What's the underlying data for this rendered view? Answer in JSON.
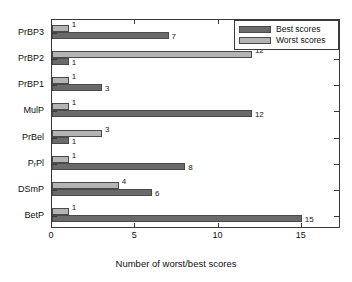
{
  "chart_data": {
    "type": "bar",
    "orientation": "horizontal",
    "title": "",
    "xlabel": "Number of worst/best scores",
    "ylabel": "",
    "xlim": [
      0,
      17.35
    ],
    "xticks": [
      0,
      5,
      10,
      15
    ],
    "xticklabels": [
      "0",
      "5",
      "10",
      "15"
    ],
    "grid": false,
    "legend_position": "upper right",
    "categories": [
      "PrBP3",
      "PrBP2",
      "PrBP1",
      "MulP",
      "PrBel",
      "PrPl",
      "DSmP",
      "BetP"
    ],
    "category_labels_html": [
      "PrBP3",
      "PrBP2",
      "PrBP1",
      "MulP",
      "PrBel",
      "P<sub>r</sub>Pl",
      "DSmP",
      "BetP"
    ],
    "series": [
      {
        "name": "Worst scores",
        "color": "#b4b4b4",
        "values": [
          1,
          12,
          1,
          1,
          3,
          1,
          4,
          1
        ]
      },
      {
        "name": "Best scores",
        "color": "#6a6a6a",
        "values": [
          7,
          1,
          3,
          12,
          1,
          8,
          6,
          15
        ]
      }
    ]
  },
  "legend": {
    "entries": [
      {
        "label": "Best scores",
        "color": "#6a6a6a"
      },
      {
        "label": "Worst scores",
        "color": "#b4b4b4"
      }
    ]
  },
  "axis": {
    "x_label": "Number of worst/best scores",
    "x_tick_labels": [
      "0",
      "5",
      "10",
      "15"
    ]
  }
}
